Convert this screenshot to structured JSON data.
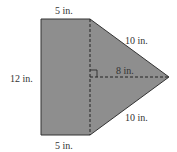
{
  "diagram": {
    "type": "composite-figure",
    "colors": {
      "fill": "#8e8e8e",
      "stroke": "#333333",
      "background": "#ffffff"
    },
    "labels": {
      "top": "5 in.",
      "bottom": "5 in.",
      "left": "12 in.",
      "upper_slant": "10 in.",
      "lower_slant": "10 in.",
      "height": "8 in."
    }
  }
}
